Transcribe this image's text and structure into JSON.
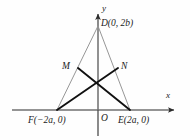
{
  "figure": {
    "background_color": "#fefefe",
    "axes": {
      "x_label": "x",
      "y_label": "y",
      "origin_label": "O",
      "axis_color": "#2b2b2b",
      "x_axis": {
        "x_start": 12,
        "x_end": 178,
        "y": 110
      },
      "y_axis": {
        "x": 98,
        "y_start": 10,
        "y_end": 136
      }
    },
    "points": [
      {
        "name": "D",
        "label": "D(0, 2b)",
        "short": "D",
        "x": 98,
        "y": 26
      },
      {
        "name": "M",
        "label": "M",
        "short": "M",
        "x": 78,
        "y": 68
      },
      {
        "name": "N",
        "label": "N",
        "short": "N",
        "x": 118,
        "y": 68
      },
      {
        "name": "F",
        "label": "F(−2a, 0)",
        "short": "F",
        "x": 57,
        "y": 110
      },
      {
        "name": "E",
        "label": "E(2a, 0)",
        "short": "E",
        "x": 130,
        "y": 110
      },
      {
        "name": "O",
        "label": "O",
        "short": "O",
        "x": 98,
        "y": 110
      }
    ],
    "segments": [
      {
        "name": "side-DF",
        "from": "D",
        "to": "F",
        "style": "thin",
        "color": "#8a8a8a",
        "width": 0.9
      },
      {
        "name": "side-DE",
        "from": "D",
        "to": "E",
        "style": "thin",
        "color": "#8a8a8a",
        "width": 0.9
      },
      {
        "name": "median-DO",
        "from": "D",
        "to": "O",
        "style": "thin",
        "color": "#9a9a9a",
        "width": 0.9
      },
      {
        "name": "cevian-FN",
        "from": "F",
        "to": "N",
        "style": "thick",
        "color": "#111111",
        "width": 1.9
      },
      {
        "name": "cevian-EM",
        "from": "E",
        "to": "M",
        "style": "thick",
        "color": "#111111",
        "width": 1.9
      }
    ],
    "colors": {
      "thin_line": "#8a8a8a",
      "thick_line": "#111111",
      "axis": "#2b2b2b",
      "text": "#1a1a1a"
    }
  }
}
